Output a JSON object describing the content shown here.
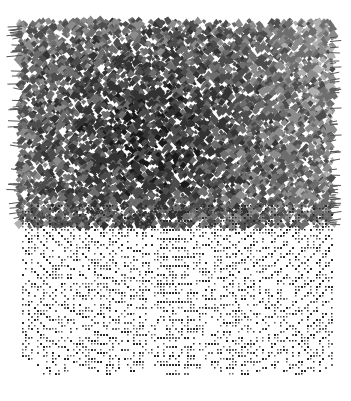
{
  "artwork": {
    "background": "#ffffff",
    "canvas": {
      "width": 351,
      "height": 401
    },
    "dense_region": {
      "x": 20,
      "y": 22,
      "width": 312,
      "height": 205,
      "colors": [
        "#1a1a1a",
        "#333333",
        "#4d4d4d",
        "#6e6e6e",
        "#8c8c8c",
        "#b0b0b0"
      ],
      "cell_size": 5,
      "darkness_center": [
        150,
        140
      ]
    },
    "grid_region": {
      "x": 22,
      "y": 205,
      "width": 310,
      "height": 170,
      "dot_color": "#2a2a2a",
      "arc_center": [
        176,
        120
      ],
      "arc_spacing": 9,
      "scallop_count": 5,
      "scallop_depth": 10
    }
  }
}
